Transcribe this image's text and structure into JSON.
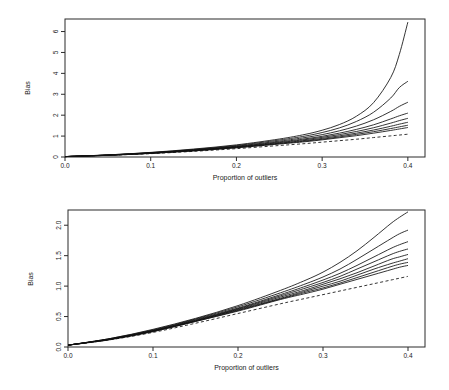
{
  "figure": {
    "title": "",
    "panels": [
      "top",
      "bottom"
    ]
  },
  "chart_data": [
    {
      "type": "line",
      "panel": "top",
      "title": "",
      "xlabel": "Proportion of outliers",
      "ylabel": "Bias",
      "xlim": [
        0.0,
        0.42
      ],
      "ylim": [
        0.0,
        6.6
      ],
      "xticks": [
        0.0,
        0.1,
        0.2,
        0.3,
        0.4
      ],
      "xticklabels": [
        "0.0",
        "0.1",
        "0.2",
        "0.3",
        "0.4"
      ],
      "yticks": [
        0,
        1,
        2,
        3,
        4,
        5,
        6
      ],
      "yticklabels": [
        "0",
        "1",
        "2",
        "3",
        "4",
        "5",
        "6"
      ],
      "grid": false,
      "legend": "none",
      "x": [
        0.0,
        0.05,
        0.1,
        0.15,
        0.2,
        0.25,
        0.28,
        0.3,
        0.32,
        0.34,
        0.36,
        0.38,
        0.39,
        0.4
      ],
      "series": [
        {
          "name": "curve-1",
          "style": "solid",
          "values": [
            0.02,
            0.1,
            0.22,
            0.38,
            0.58,
            0.86,
            1.08,
            1.28,
            1.55,
            1.95,
            2.6,
            3.8,
            4.9,
            6.45
          ]
        },
        {
          "name": "curve-2",
          "style": "solid",
          "values": [
            0.02,
            0.1,
            0.21,
            0.36,
            0.55,
            0.81,
            1.0,
            1.17,
            1.39,
            1.7,
            2.14,
            2.82,
            3.32,
            3.62
          ]
        },
        {
          "name": "curve-3",
          "style": "solid",
          "values": [
            0.02,
            0.09,
            0.2,
            0.34,
            0.52,
            0.76,
            0.93,
            1.07,
            1.25,
            1.48,
            1.78,
            2.18,
            2.42,
            2.62
          ]
        },
        {
          "name": "curve-4",
          "style": "solid",
          "values": [
            0.02,
            0.09,
            0.19,
            0.33,
            0.5,
            0.72,
            0.87,
            0.99,
            1.14,
            1.32,
            1.54,
            1.82,
            1.97,
            2.1
          ]
        },
        {
          "name": "curve-5",
          "style": "solid",
          "values": [
            0.02,
            0.09,
            0.19,
            0.32,
            0.48,
            0.69,
            0.83,
            0.94,
            1.07,
            1.22,
            1.4,
            1.62,
            1.74,
            1.85
          ]
        },
        {
          "name": "curve-6",
          "style": "solid",
          "values": [
            0.02,
            0.09,
            0.18,
            0.31,
            0.47,
            0.66,
            0.79,
            0.89,
            1.01,
            1.14,
            1.29,
            1.47,
            1.57,
            1.66
          ]
        },
        {
          "name": "curve-7",
          "style": "solid",
          "values": [
            0.02,
            0.08,
            0.18,
            0.3,
            0.45,
            0.64,
            0.76,
            0.85,
            0.96,
            1.08,
            1.21,
            1.36,
            1.44,
            1.52
          ]
        },
        {
          "name": "curve-8",
          "style": "solid",
          "values": [
            0.02,
            0.08,
            0.17,
            0.29,
            0.44,
            0.62,
            0.73,
            0.82,
            0.92,
            1.02,
            1.14,
            1.27,
            1.34,
            1.41
          ]
        },
        {
          "name": "curve-dashed",
          "style": "dashed",
          "values": [
            0.02,
            0.08,
            0.16,
            0.27,
            0.4,
            0.55,
            0.64,
            0.71,
            0.78,
            0.85,
            0.93,
            1.01,
            1.05,
            1.09
          ]
        }
      ]
    },
    {
      "type": "line",
      "panel": "bottom",
      "title": "",
      "xlabel": "Proportion of outliers",
      "ylabel": "Bias",
      "xlim": [
        0.0,
        0.42
      ],
      "ylim": [
        0.0,
        2.25
      ],
      "xticks": [
        0.0,
        0.1,
        0.2,
        0.3,
        0.4
      ],
      "xticklabels": [
        "0.0",
        "0.1",
        "0.2",
        "0.3",
        "0.4"
      ],
      "yticks": [
        0.0,
        0.5,
        1.0,
        1.5,
        2.0
      ],
      "yticklabels": [
        "0.0",
        "0.5",
        "1.0",
        "1.5",
        "2.0"
      ],
      "grid": false,
      "legend": "none",
      "x": [
        0.0,
        0.05,
        0.1,
        0.15,
        0.2,
        0.25,
        0.28,
        0.3,
        0.32,
        0.34,
        0.36,
        0.38,
        0.39,
        0.4
      ],
      "series": [
        {
          "name": "curve-1",
          "style": "solid",
          "values": [
            0.03,
            0.14,
            0.29,
            0.47,
            0.68,
            0.93,
            1.1,
            1.23,
            1.39,
            1.58,
            1.8,
            2.03,
            2.13,
            2.22
          ]
        },
        {
          "name": "curve-2",
          "style": "solid",
          "values": [
            0.03,
            0.14,
            0.28,
            0.46,
            0.66,
            0.89,
            1.04,
            1.15,
            1.28,
            1.44,
            1.61,
            1.78,
            1.86,
            1.92
          ]
        },
        {
          "name": "curve-3",
          "style": "solid",
          "values": [
            0.03,
            0.13,
            0.27,
            0.45,
            0.64,
            0.86,
            1.0,
            1.1,
            1.21,
            1.34,
            1.48,
            1.62,
            1.68,
            1.73
          ]
        },
        {
          "name": "curve-4",
          "style": "solid",
          "values": [
            0.03,
            0.13,
            0.27,
            0.44,
            0.63,
            0.84,
            0.97,
            1.06,
            1.16,
            1.28,
            1.4,
            1.52,
            1.57,
            1.61
          ]
        },
        {
          "name": "curve-5",
          "style": "solid",
          "values": [
            0.03,
            0.13,
            0.26,
            0.43,
            0.62,
            0.82,
            0.94,
            1.03,
            1.12,
            1.22,
            1.33,
            1.44,
            1.48,
            1.52
          ]
        },
        {
          "name": "curve-6",
          "style": "solid",
          "values": [
            0.03,
            0.13,
            0.26,
            0.43,
            0.61,
            0.8,
            0.92,
            1.0,
            1.08,
            1.18,
            1.28,
            1.37,
            1.41,
            1.45
          ]
        },
        {
          "name": "curve-7",
          "style": "solid",
          "values": [
            0.03,
            0.13,
            0.26,
            0.42,
            0.6,
            0.79,
            0.9,
            0.97,
            1.05,
            1.14,
            1.23,
            1.32,
            1.36,
            1.39
          ]
        },
        {
          "name": "curve-8",
          "style": "solid",
          "values": [
            0.03,
            0.12,
            0.25,
            0.42,
            0.59,
            0.78,
            0.88,
            0.95,
            1.03,
            1.11,
            1.19,
            1.27,
            1.31,
            1.34
          ]
        },
        {
          "name": "curve-dashed",
          "style": "dashed",
          "values": [
            0.03,
            0.12,
            0.24,
            0.39,
            0.55,
            0.71,
            0.8,
            0.86,
            0.92,
            0.98,
            1.04,
            1.1,
            1.13,
            1.16
          ]
        }
      ]
    }
  ]
}
